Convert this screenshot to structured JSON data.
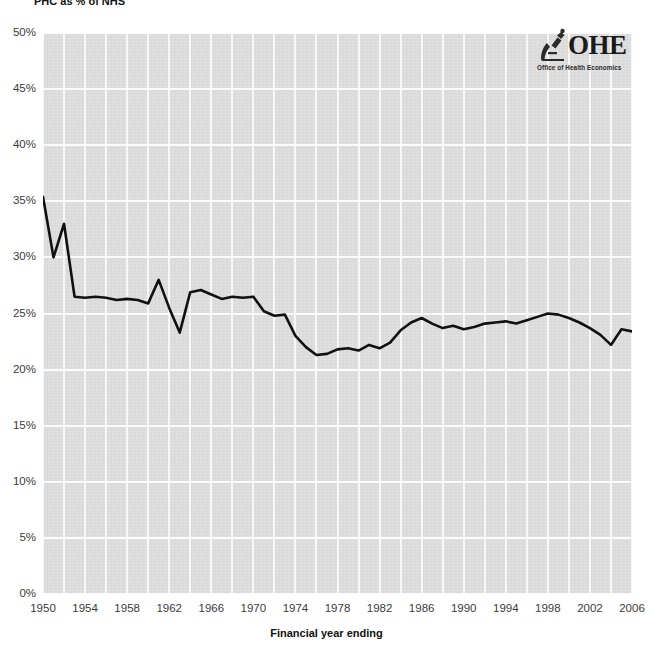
{
  "title": "PHC as % of NHS",
  "logo": {
    "wordmark": "OHE",
    "tagline": "Office of Health Economics",
    "icon": "microscope-icon"
  },
  "axes": {
    "y_ticks": [
      "0%",
      "5%",
      "10%",
      "15%",
      "20%",
      "25%",
      "30%",
      "35%",
      "40%",
      "45%",
      "50%"
    ],
    "x_ticks": [
      "1950",
      "1954",
      "1958",
      "1962",
      "1966",
      "1970",
      "1974",
      "1978",
      "1982",
      "1986",
      "1990",
      "1994",
      "1998",
      "2002",
      "2006"
    ],
    "x_title": "Financial year ending",
    "y_title": ""
  },
  "chart_data": {
    "type": "line",
    "title": "PHC as % of NHS",
    "xlabel": "Financial year ending",
    "ylabel": "",
    "ylim": [
      0,
      50
    ],
    "xlim": [
      1950,
      2006
    ],
    "y_unit": "%",
    "grid": true,
    "legend": "none",
    "line_color": "#111111",
    "plot_background": "#dcdcdc",
    "gridline_color": "#f7f7f7",
    "x": [
      1950,
      1951,
      1952,
      1953,
      1954,
      1955,
      1956,
      1957,
      1958,
      1959,
      1960,
      1961,
      1962,
      1963,
      1964,
      1965,
      1966,
      1967,
      1968,
      1969,
      1970,
      1971,
      1972,
      1973,
      1974,
      1975,
      1976,
      1977,
      1978,
      1979,
      1980,
      1981,
      1982,
      1983,
      1984,
      1985,
      1986,
      1987,
      1988,
      1989,
      1990,
      1991,
      1992,
      1993,
      1994,
      1995,
      1996,
      1997,
      1998,
      1999,
      2000,
      2001,
      2002,
      2003,
      2004,
      2005,
      2006
    ],
    "values": [
      35.4,
      30.0,
      33.0,
      26.5,
      26.4,
      26.5,
      26.4,
      26.2,
      26.3,
      26.2,
      25.9,
      28.0,
      25.5,
      23.3,
      26.9,
      27.1,
      26.7,
      26.3,
      26.5,
      26.4,
      26.5,
      25.2,
      24.8,
      24.9,
      23.0,
      22.0,
      21.3,
      21.4,
      21.8,
      21.9,
      21.7,
      22.2,
      21.9,
      22.4,
      23.5,
      24.2,
      24.6,
      24.1,
      23.7,
      23.9,
      23.6,
      23.8,
      24.1,
      24.2,
      24.3,
      24.1,
      24.4,
      24.7,
      25.0,
      24.9,
      24.6,
      24.2,
      23.7,
      23.1,
      22.2,
      23.6,
      23.4
    ],
    "series": [
      {
        "name": "PHC as % of NHS",
        "values": [
          35.4,
          30.0,
          33.0,
          26.5,
          26.4,
          26.5,
          26.4,
          26.2,
          26.3,
          26.2,
          25.9,
          28.0,
          25.5,
          23.3,
          26.9,
          27.1,
          26.7,
          26.3,
          26.5,
          26.4,
          26.5,
          25.2,
          24.8,
          24.9,
          23.0,
          22.0,
          21.3,
          21.4,
          21.8,
          21.9,
          21.7,
          22.2,
          21.9,
          22.4,
          23.5,
          24.2,
          24.6,
          24.1,
          23.7,
          23.9,
          23.6,
          23.8,
          24.1,
          24.2,
          24.3,
          24.1,
          24.4,
          24.7,
          25.0,
          24.9,
          24.6,
          24.2,
          23.7,
          23.1,
          22.2,
          23.6,
          23.4
        ]
      }
    ]
  }
}
